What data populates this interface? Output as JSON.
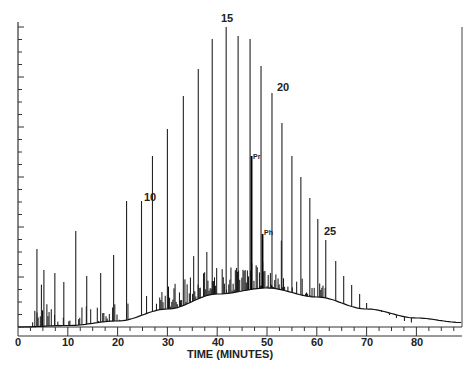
{
  "chart_data": {
    "type": "line",
    "title": "",
    "xlabel": "TIME (MINUTES)",
    "ylabel": "",
    "xlim": [
      0,
      89
    ],
    "x_ticks": [
      0,
      10,
      20,
      30,
      40,
      50,
      60,
      70,
      80
    ],
    "grid": false,
    "legend": null,
    "annotations": [
      {
        "text": "10",
        "x": 21.2,
        "peak": "n-C10"
      },
      {
        "text": "15",
        "x": 41.8,
        "peak": "n-C15"
      },
      {
        "text": "20",
        "x": 51.0,
        "peak": "n-C20"
      },
      {
        "text": "25",
        "x": 61.0,
        "peak": "n-C25"
      },
      {
        "text": "Pr",
        "x": 46.6,
        "peak": "pristane"
      },
      {
        "text": "Ph",
        "x": 48.8,
        "peak": "phytane"
      }
    ],
    "series": [
      {
        "name": "n-alkane peaks",
        "x": [
          3.8,
          5.2,
          7.4,
          9.2,
          11.6,
          13.8,
          16.6,
          19.2,
          21.8,
          24.8,
          27.0,
          30.0,
          33.2,
          36.2,
          39.0,
          41.8,
          44.2,
          46.6,
          48.8,
          51.0,
          53.0,
          55.0,
          56.8,
          58.6,
          60.2,
          61.8,
          63.8,
          65.4,
          67.0,
          68.6,
          70.0,
          71.6,
          73.0,
          74.6,
          76.0,
          77.6,
          79.0
        ],
        "values": [
          26,
          19,
          18,
          15,
          32,
          17,
          18,
          24,
          42,
          42,
          57,
          66,
          77,
          86,
          96,
          100,
          97,
          96,
          87,
          78,
          68,
          57,
          50,
          43,
          36,
          29,
          22,
          17,
          14,
          11,
          8,
          6,
          5,
          4,
          3,
          2,
          1.5
        ]
      },
      {
        "name": "unresolved complex mixture hump",
        "x": [
          0,
          10,
          20,
          30,
          40,
          50,
          60,
          70,
          80,
          89
        ],
        "values": [
          0,
          0.5,
          2,
          6,
          11,
          13,
          10,
          6,
          3,
          1.5
        ]
      }
    ]
  },
  "axes": {
    "x_title": "TIME (MINUTES)",
    "x_tick_labels": [
      "0",
      "10",
      "20",
      "30",
      "40",
      "50",
      "60",
      "70",
      "80"
    ]
  },
  "labels": {
    "c10": "10",
    "c15": "15",
    "c20": "20",
    "c25": "25",
    "pristane": "Pr",
    "phytane": "Ph"
  }
}
